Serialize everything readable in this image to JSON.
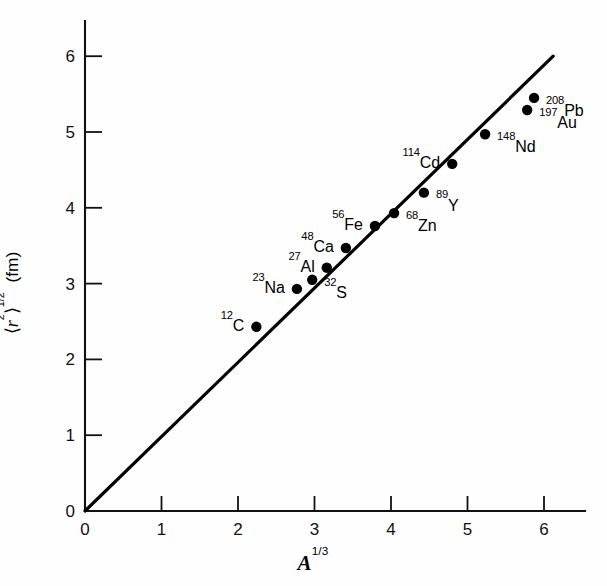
{
  "chart_data": {
    "type": "scatter",
    "title": "",
    "subtitle": "",
    "xlabel_plain": "A^1/3",
    "xlabel_base": "A",
    "xlabel_sup": "1/3",
    "ylabel_plain": "<r^2>^1/2 (fm)",
    "ylabel_parts": {
      "open_bracket": "⟨",
      "var": "r",
      "var_sup": "2",
      "close_bracket": "⟩",
      "root_sup": "1/2",
      "unit": "(fm)"
    },
    "xlim": [
      0,
      6.55
    ],
    "ylim": [
      0,
      6.4
    ],
    "xticks": [
      "0",
      "1",
      "2",
      "3",
      "4",
      "5",
      "6"
    ],
    "xtick_values": [
      0,
      1,
      2,
      3,
      4,
      5,
      6
    ],
    "yticks": [
      "0",
      "1",
      "2",
      "3",
      "4",
      "5",
      "6"
    ],
    "ytick_values": [
      0,
      1,
      2,
      3,
      4,
      5,
      6
    ],
    "grid": false,
    "legend": "none",
    "series_color": "#000000",
    "line_color": "#000000",
    "background": "#ffffff",
    "fit_line": {
      "label": "linear fit through origin",
      "slope": 0.98,
      "intercept": 0.0,
      "x_start": 0.0,
      "y_start": 0.0,
      "x_end": 6.12,
      "y_end": 6.0
    },
    "points": [
      {
        "label_sup": "12",
        "label_el": "C",
        "x": 2.24,
        "y": 2.43,
        "label_side": "left"
      },
      {
        "label_sup": "23",
        "label_el": "Na",
        "x": 2.77,
        "y": 2.93,
        "label_side": "left"
      },
      {
        "label_sup": "32",
        "label_el": "S",
        "x": 2.97,
        "y": 3.05,
        "label_side": "right"
      },
      {
        "label_sup": "27",
        "label_el": "Al",
        "x": 3.16,
        "y": 3.21,
        "label_side": "left"
      },
      {
        "label_sup": "48",
        "label_el": "Ca",
        "x": 3.41,
        "y": 3.47,
        "label_side": "left"
      },
      {
        "label_sup": "56",
        "label_el": "Fe",
        "x": 3.79,
        "y": 3.76,
        "label_side": "left"
      },
      {
        "label_sup": "68",
        "label_el": "Zn",
        "x": 4.04,
        "y": 3.93,
        "label_side": "right"
      },
      {
        "label_sup": "89",
        "label_el": "Y",
        "x": 4.43,
        "y": 4.2,
        "label_side": "right"
      },
      {
        "label_sup": "114",
        "label_el": "Cd",
        "x": 4.8,
        "y": 4.58,
        "label_side": "left"
      },
      {
        "label_sup": "148",
        "label_el": "Nd",
        "x": 5.23,
        "y": 4.97,
        "label_side": "right"
      },
      {
        "label_sup": "197",
        "label_el": "Au",
        "x": 5.78,
        "y": 5.29,
        "label_side": "right"
      },
      {
        "label_sup": "208",
        "label_el": "Pb",
        "x": 5.87,
        "y": 5.45,
        "label_side": "right"
      }
    ]
  }
}
